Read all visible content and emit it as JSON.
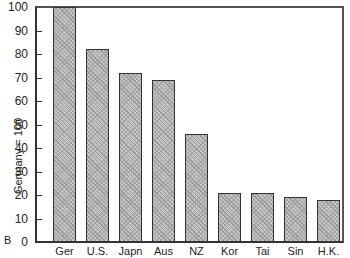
{
  "chart_data": {
    "type": "bar",
    "title": "",
    "panel_label": "B",
    "xlabel": "",
    "ylabel": "Germany = 100",
    "ylim": [
      0,
      100
    ],
    "yticks": [
      0,
      10,
      20,
      30,
      40,
      50,
      60,
      70,
      80,
      90,
      100
    ],
    "grid": false,
    "legend": null,
    "categories": [
      "Ger",
      "U.S.",
      "Japn",
      "Aus",
      "NZ",
      "Kor",
      "Tai",
      "Sin",
      "H.K."
    ],
    "values": [
      100,
      82,
      72,
      69,
      46,
      21,
      21,
      19,
      18
    ]
  }
}
